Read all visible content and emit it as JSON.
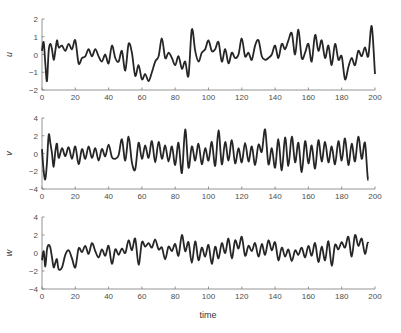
{
  "chart_data": [
    {
      "type": "line",
      "title": "",
      "xlabel": "",
      "ylabel": "u",
      "xlim": [
        0,
        200
      ],
      "ylim": [
        -2,
        2
      ],
      "xticks": [
        0,
        20,
        40,
        60,
        80,
        100,
        120,
        140,
        160,
        180,
        200
      ],
      "yticks": [
        -2,
        -1,
        0,
        1,
        2
      ],
      "grid": false,
      "series": [
        {
          "name": "u",
          "x": [
            0,
            1,
            2,
            3,
            4,
            5,
            6,
            7,
            8,
            9,
            10,
            12,
            14,
            16,
            18,
            20,
            22,
            24,
            26,
            28,
            30,
            32,
            34,
            36,
            38,
            40,
            42,
            44,
            46,
            48,
            50,
            52,
            54,
            56,
            58,
            60,
            62,
            64,
            66,
            68,
            70,
            72,
            74,
            76,
            78,
            80,
            82,
            84,
            86,
            88,
            90,
            92,
            94,
            96,
            98,
            100,
            102,
            104,
            106,
            108,
            110,
            112,
            114,
            116,
            118,
            120,
            122,
            124,
            126,
            128,
            130,
            132,
            134,
            136,
            138,
            140,
            142,
            144,
            146,
            148,
            150,
            152,
            154,
            156,
            158,
            160,
            162,
            164,
            166,
            168,
            170,
            172,
            174,
            176,
            178,
            180,
            182,
            184,
            186,
            188,
            190,
            192,
            194,
            196,
            198,
            200
          ],
          "values": [
            0.2,
            0.7,
            -0.5,
            -1.5,
            0.2,
            0.6,
            0.3,
            -0.3,
            0.2,
            0.8,
            0.4,
            0.5,
            0.2,
            0.6,
            0.3,
            0.8,
            -0.5,
            -0.2,
            -0.1,
            0.3,
            -0.1,
            0.3,
            -0.1,
            -0.4,
            0.0,
            -0.5,
            0.5,
            -0.2,
            -0.4,
            0.2,
            -0.9,
            0.6,
            0.1,
            -1.2,
            -0.6,
            -1.4,
            -1.1,
            -1.5,
            -1.0,
            -0.4,
            -0.1,
            0.9,
            -0.2,
            0.1,
            -0.2,
            -0.6,
            -0.1,
            -0.8,
            -0.4,
            -1.2,
            1.4,
            0.2,
            -0.4,
            0.1,
            0.3,
            0.8,
            0.2,
            0.3,
            0.7,
            -0.4,
            0.3,
            -0.5,
            0.1,
            -0.2,
            0.0,
            0.9,
            -0.1,
            0.1,
            -0.3,
            0.5,
            0.8,
            -0.1,
            -0.3,
            -0.2,
            0.0,
            0.5,
            -0.2,
            0.6,
            0.3,
            0.8,
            1.2,
            0.0,
            1.4,
            -0.2,
            0.1,
            0.6,
            -0.4,
            1.1,
            0.2,
            0.8,
            -0.2,
            0.5,
            -0.6,
            0.6,
            -0.3,
            -0.1,
            -1.4,
            -0.7,
            -0.2,
            -0.6,
            0.2,
            -0.1,
            0.4,
            -0.1,
            1.6,
            -1.1
          ]
        }
      ]
    },
    {
      "type": "line",
      "title": "",
      "xlabel": "",
      "ylabel": "v",
      "xlim": [
        0,
        200
      ],
      "ylim": [
        -4,
        4
      ],
      "xticks": [
        0,
        20,
        40,
        60,
        80,
        100,
        120,
        140,
        160,
        180,
        200
      ],
      "yticks": [
        -4,
        -2,
        0,
        2,
        4
      ],
      "grid": false,
      "series": [
        {
          "name": "v",
          "x": [
            0,
            1,
            2,
            3,
            4,
            5,
            6,
            7,
            8,
            9,
            10,
            12,
            14,
            16,
            18,
            20,
            22,
            24,
            26,
            28,
            30,
            32,
            34,
            36,
            38,
            40,
            42,
            44,
            46,
            48,
            50,
            52,
            54,
            56,
            58,
            60,
            62,
            64,
            66,
            68,
            70,
            72,
            74,
            76,
            78,
            80,
            82,
            84,
            86,
            88,
            90,
            92,
            94,
            96,
            98,
            100,
            102,
            104,
            106,
            108,
            110,
            112,
            114,
            116,
            118,
            120,
            122,
            124,
            126,
            128,
            130,
            132,
            134,
            136,
            138,
            140,
            142,
            144,
            146,
            148,
            150,
            152,
            154,
            156,
            158,
            160,
            162,
            164,
            166,
            168,
            170,
            172,
            174,
            176,
            178,
            180,
            182,
            184,
            186,
            188,
            190,
            192,
            194,
            196,
            198,
            200
          ],
          "values": [
            0.5,
            -2.0,
            -2.9,
            -1.0,
            2.1,
            1.2,
            0.0,
            -1.5,
            0.2,
            1.1,
            -0.5,
            0.6,
            -0.3,
            0.7,
            -0.6,
            0.8,
            -1.2,
            0.5,
            -0.6,
            0.8,
            -0.5,
            0.6,
            -0.8,
            0.5,
            -0.3,
            1.0,
            -0.4,
            -0.6,
            -0.2,
            1.6,
            -0.8,
            1.9,
            -1.0,
            -1.8,
            1.2,
            -0.6,
            0.9,
            -0.5,
            1.4,
            -1.0,
            1.3,
            -0.6,
            0.9,
            -0.9,
            0.8,
            -1.3,
            1.2,
            -2.2,
            2.7,
            -1.6,
            0.8,
            -0.8,
            1.1,
            -1.2,
            0.6,
            -0.8,
            1.3,
            -1.4,
            2.6,
            -1.2,
            1.3,
            -0.8,
            1.5,
            -1.1,
            0.6,
            -1.0,
            1.2,
            -0.9,
            0.8,
            -1.3,
            1.0,
            0.2,
            2.7,
            -1.2,
            0.6,
            -1.6,
            1.6,
            -1.9,
            1.8,
            -1.4,
            1.9,
            -1.0,
            1.2,
            -2.1,
            1.4,
            -1.1,
            0.9,
            -1.7,
            1.5,
            -0.9,
            1.3,
            -1.0,
            0.8,
            -1.2,
            1.4,
            -0.8,
            1.7,
            -1.3,
            1.1,
            -0.9,
            1.9,
            -0.6,
            1.2,
            -3.0,
            1.4
          ]
        }
      ]
    },
    {
      "type": "line",
      "title": "",
      "xlabel": "time",
      "ylabel": "w",
      "xlim": [
        0,
        200
      ],
      "ylim": [
        -4,
        4
      ],
      "xticks": [
        0,
        20,
        40,
        60,
        80,
        100,
        120,
        140,
        160,
        180,
        200
      ],
      "yticks": [
        -4,
        -2,
        0,
        2,
        4
      ],
      "grid": false,
      "series": [
        {
          "name": "w",
          "x": [
            0,
            1,
            2,
            3,
            4,
            5,
            6,
            7,
            8,
            9,
            10,
            12,
            14,
            16,
            18,
            20,
            22,
            24,
            26,
            28,
            30,
            32,
            34,
            36,
            38,
            40,
            42,
            44,
            46,
            48,
            50,
            52,
            54,
            56,
            58,
            60,
            62,
            64,
            66,
            68,
            70,
            72,
            74,
            76,
            78,
            80,
            82,
            84,
            86,
            88,
            90,
            92,
            94,
            96,
            98,
            100,
            102,
            104,
            106,
            108,
            110,
            112,
            114,
            116,
            118,
            120,
            122,
            124,
            126,
            128,
            130,
            132,
            134,
            136,
            138,
            140,
            142,
            144,
            146,
            148,
            150,
            152,
            154,
            156,
            158,
            160,
            162,
            164,
            166,
            168,
            170,
            172,
            174,
            176,
            178,
            180,
            182,
            184,
            186,
            188,
            190,
            192,
            194,
            196,
            198,
            200
          ],
          "values": [
            -0.8,
            0.2,
            -1.5,
            0.4,
            0.9,
            0.6,
            -0.5,
            -1.6,
            -1.1,
            -0.7,
            -1.8,
            -1.6,
            -0.2,
            0.3,
            -0.6,
            -1.6,
            0.5,
            0.1,
            0.8,
            -0.1,
            1.1,
            0.2,
            -0.5,
            0.4,
            -0.3,
            0.8,
            -1.2,
            0.4,
            -0.2,
            0.5,
            0.0,
            1.4,
            0.3,
            1.6,
            -1.3,
            1.2,
            0.7,
            1.1,
            0.6,
            1.5,
            0.4,
            0.6,
            -0.7,
            0.7,
            0.2,
            1.0,
            -0.3,
            2.0,
            0.2,
            1.2,
            -1.1,
            1.3,
            -0.8,
            0.6,
            -0.4,
            0.9,
            -1.2,
            0.7,
            -0.6,
            1.1,
            0.0,
            1.6,
            -0.6,
            1.4,
            0.5,
            1.8,
            -0.3,
            0.8,
            0.2,
            1.1,
            -0.4,
            1.0,
            -0.2,
            1.4,
            0.3,
            1.2,
            -0.8,
            0.6,
            -0.4,
            0.4,
            -0.9,
            0.3,
            -0.2,
            0.6,
            -0.5,
            0.8,
            -0.3,
            1.1,
            -1.0,
            0.7,
            -0.8,
            1.3,
            -1.4,
            0.9,
            0.4,
            1.2,
            0.6,
            1.8,
            -0.4,
            2.0,
            0.8,
            1.6,
            -0.1,
            1.1,
            -2.3
          ]
        }
      ]
    }
  ],
  "figure": {
    "xlabel": "time",
    "panels": [
      {
        "ylabel": "u",
        "yticks": [
          "2",
          "1",
          "0",
          "−1",
          "−2"
        ]
      },
      {
        "ylabel": "v",
        "yticks": [
          "4",
          "2",
          "0",
          "−2",
          "−4"
        ]
      },
      {
        "ylabel": "w",
        "yticks": [
          "4",
          "2",
          "0",
          "−2",
          "−4"
        ]
      }
    ],
    "xticks": [
      "0",
      "20",
      "40",
      "60",
      "80",
      "100",
      "120",
      "140",
      "160",
      "180",
      "200"
    ],
    "line_color": "#262626",
    "axis_color": "#7a7a7a"
  }
}
